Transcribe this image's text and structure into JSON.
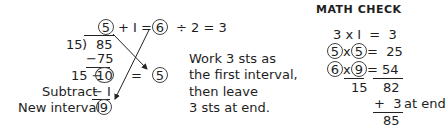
{
  "division": {
    "quotient": "5",
    "plus_one": "+ I =",
    "result_six": "6",
    "div_two": "÷ 2 = 3",
    "divisor": "15",
    "bracket": ")",
    "dividend": "85",
    "minus_product": "−75",
    "remainder_prefix": "15 −",
    "remainder": "10",
    "equals": "=",
    "half_result": "5",
    "subtract_label": "Subtract",
    "subtract_value": "− I",
    "new_interval_label": "New interval",
    "new_interval_value": "9"
  },
  "instructions": {
    "lines": [
      "Work 3 sts as",
      "the first interval,",
      "then leave",
      "3 sts at end."
    ]
  },
  "math_check": {
    "title": "MATH CHECK",
    "row1": "3 x I  =  3",
    "row2_a": "5",
    "row2_x": "x",
    "row2_b": "5",
    "row2_eq": "=  25",
    "row3_a": "6",
    "row3_x": "x",
    "row3_b": "9",
    "row3_eq": "=",
    "row3_val": "54",
    "sum_left": "15",
    "sum_right": "82",
    "plus_three": "+  3",
    "at_end": "at end",
    "total": "85"
  }
}
